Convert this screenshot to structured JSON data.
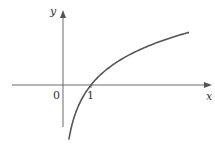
{
  "chart_data": {
    "type": "line",
    "title": "",
    "function": "y = ln x",
    "xlabel": "x",
    "ylabel": "y",
    "origin_label": "0",
    "x_tick_labels": [
      "1"
    ],
    "x_ticks": [
      1
    ],
    "grid": false,
    "legend": null,
    "xlim": [
      -1.8,
      5.2
    ],
    "ylim": [
      -1.6,
      2.2
    ],
    "series": [
      {
        "name": "ln x",
        "x": [
          0.21,
          0.3,
          0.4,
          0.5,
          0.7,
          1.0,
          1.5,
          2.0,
          2.5,
          3.0,
          3.5,
          4.0,
          4.5
        ],
        "y": [
          -1.56,
          -1.2,
          -0.92,
          -0.69,
          -0.36,
          0.0,
          0.41,
          0.69,
          0.92,
          1.1,
          1.25,
          1.39,
          1.5
        ]
      }
    ],
    "colors": {
      "axis": "#555555",
      "curve": "#555555",
      "text": "#333333"
    }
  },
  "labels": {
    "y_axis": "y",
    "x_axis": "x",
    "origin": "0",
    "tick_1": "1"
  }
}
